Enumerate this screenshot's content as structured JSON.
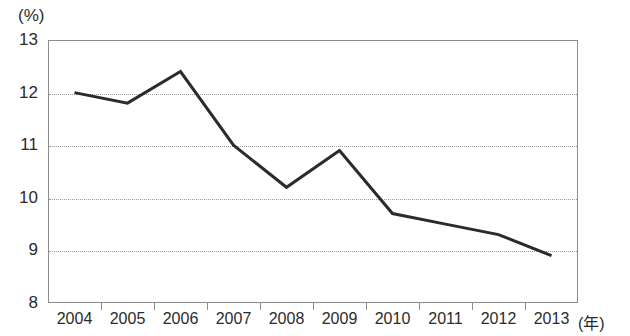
{
  "chart_data": {
    "type": "line",
    "title": "",
    "xlabel": "(年)",
    "ylabel": "(%)",
    "categories": [
      "2004",
      "2005",
      "2006",
      "2007",
      "2008",
      "2009",
      "2010",
      "2011",
      "2012",
      "2013"
    ],
    "values": [
      12.0,
      11.8,
      12.4,
      11.0,
      10.2,
      10.9,
      9.7,
      9.5,
      9.3,
      8.9
    ],
    "series": [
      {
        "name": "",
        "values": [
          12.0,
          11.8,
          12.4,
          11.0,
          10.2,
          10.9,
          9.7,
          9.5,
          9.3,
          8.9
        ]
      }
    ],
    "ylim": [
      8,
      13
    ],
    "ytick_labels": [
      "13",
      "12",
      "11",
      "10",
      "9",
      "8"
    ],
    "ytick_values": [
      13,
      12,
      11,
      10,
      9,
      8
    ],
    "grid": true,
    "grid_style": "dotted-horizontal",
    "legend": "none",
    "line_color": "#2b2b2b",
    "line_width": 3,
    "markers": "none",
    "frame_color": "#8c8c8c",
    "background": "#ffffff"
  },
  "axes": {
    "y_unit": "(%)",
    "x_unit": "(年)"
  }
}
